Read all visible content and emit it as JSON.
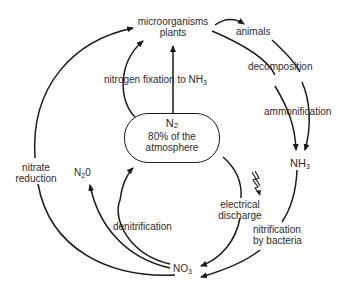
{
  "diagram": {
    "nodes": {
      "microorganisms": "microorganisms",
      "plants": "plants",
      "animals": "animals",
      "nh3_base": "NH",
      "nh3_sub": "3",
      "n2_base": "N",
      "n2_sub": "2",
      "n2_line2": "80% of the",
      "n2_line3": "atmosphere",
      "n2o_pre": "N",
      "n2o_sub": "2",
      "n2o_post": "0",
      "no3_base": "NO",
      "no3_sub": "3"
    },
    "processes": {
      "nitrogen_fixation": "nitrogen fixation to NH",
      "nitrogen_fixation_sub": "3",
      "decomposition": "decomposition",
      "ammonification": "ammonification",
      "nitrate_reduction_1": "nitrate",
      "nitrate_reduction_2": "reduction",
      "denitrification": "denitrification",
      "electrical_discharge_1": "electrical",
      "electrical_discharge_2": "discharge",
      "nitrification_1": "nitrification",
      "nitrification_2": "by bacteria"
    },
    "edges": [
      {
        "from": "N2",
        "to": "microorganisms/plants",
        "label": "nitrogen fixation to NH3"
      },
      {
        "from": "N2",
        "to": "microorganisms/plants",
        "label": "nitrogen fixation (curved)"
      },
      {
        "from": "microorganisms/plants",
        "to": "animals"
      },
      {
        "from": "microorganisms/plants",
        "to": "NH3",
        "label": "decomposition / ammonification"
      },
      {
        "from": "animals",
        "to": "NH3",
        "label": "decomposition / ammonification"
      },
      {
        "from": "NH3",
        "to": "NO3",
        "label": "nitrification by bacteria"
      },
      {
        "from": "N2",
        "to": "NO3",
        "label": "electrical discharge"
      },
      {
        "from": "NO3",
        "to": "N2",
        "label": "denitrification"
      },
      {
        "from": "NO3",
        "to": "N2O",
        "label": "denitrification"
      },
      {
        "from": "NO3",
        "to": "microorganisms/plants",
        "label": "nitrate reduction"
      }
    ],
    "colors": {
      "stroke": "#1a1a1a",
      "text": "#2a2a2a",
      "background": "#ffffff"
    }
  }
}
